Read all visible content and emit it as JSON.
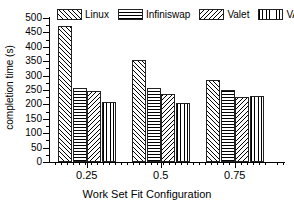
{
  "chart_data": {
    "type": "bar",
    "title": "",
    "xlabel": "Work Set Fit Configuration",
    "ylabel": "completion time (s)",
    "categories": [
      "0.25",
      "0.5",
      "0.75"
    ],
    "series": [
      {
        "name": "Linux",
        "pattern": "diagonal-forward",
        "values": [
          474,
          354,
          285
        ]
      },
      {
        "name": "Infiniswap",
        "pattern": "horizontal",
        "values": [
          257,
          257,
          250
        ]
      },
      {
        "name": "Valet",
        "pattern": "diagonal-back",
        "values": [
          246,
          236,
          226
        ]
      },
      {
        "name": "VANDI",
        "pattern": "vertical",
        "values": [
          208,
          205,
          229
        ]
      }
    ],
    "ylim": [
      0,
      500
    ],
    "yticks": [
      0,
      50,
      100,
      150,
      200,
      250,
      300,
      350,
      400,
      450,
      500
    ],
    "ytick_labels": [
      "0",
      "50",
      "100",
      "150",
      "200",
      "250",
      "300",
      "350",
      "400",
      "450",
      "500"
    ],
    "grid": false,
    "legend_position": "top"
  },
  "legend": {
    "entries": [
      {
        "label": "Linux"
      },
      {
        "label": "Infiniswap"
      },
      {
        "label": "Valet"
      },
      {
        "label": "VANDI"
      }
    ]
  },
  "axes": {
    "x_title": "Work Set Fit Configuration",
    "y_title": "completion time (s)",
    "x_labels": [
      "0.25",
      "0.5",
      "0.75"
    ],
    "y_labels": [
      "500",
      "450",
      "400",
      "350",
      "300",
      "250",
      "200",
      "150",
      "100",
      "50",
      "0"
    ]
  },
  "colors": {
    "line": "#000000",
    "background": "#ffffff",
    "bar_edge": "#222222"
  }
}
